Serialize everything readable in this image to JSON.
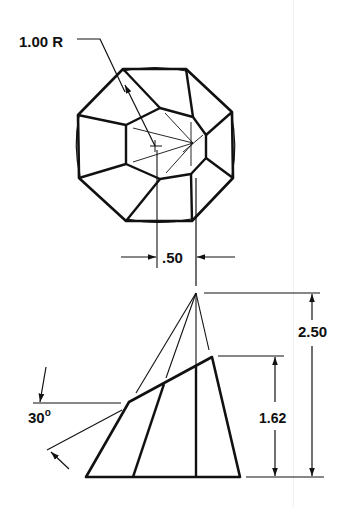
{
  "drawing": {
    "top_view": {
      "radius_label": "1.00 R",
      "offset_label": ".50"
    },
    "side_view": {
      "total_height_label": "2.50",
      "frustum_height_label": "1.62",
      "angle_value": "30",
      "angle_unit": "o"
    },
    "colors": {
      "line": "#111111",
      "background": "#ffffff"
    }
  }
}
